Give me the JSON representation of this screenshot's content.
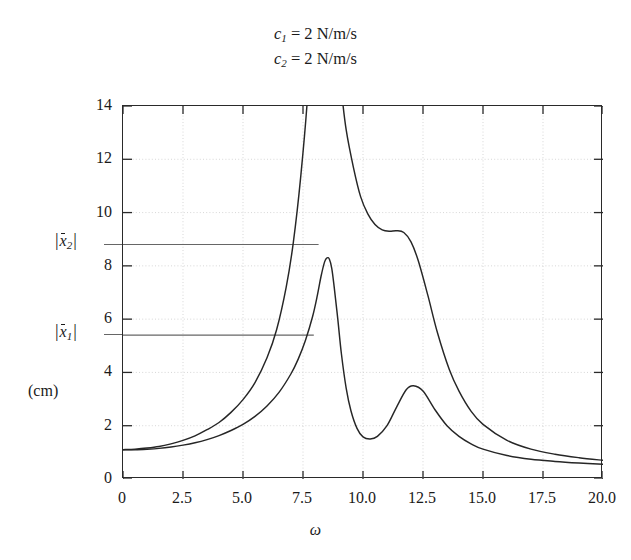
{
  "title": {
    "line1_symbol": "c",
    "line1_sub": "1",
    "line1_rest": "= 2 N/m/s",
    "line2_symbol": "c",
    "line2_sub": "2",
    "line2_rest": "= 2 N/m/s"
  },
  "axes": {
    "xlabel": "ω",
    "ylabel_unit": "(cm)",
    "xticks": [
      "0",
      "2.5",
      "5.0",
      "7.5",
      "10.0",
      "12.5",
      "15.0",
      "17.5",
      "20.0"
    ],
    "yticks": [
      "0",
      "2",
      "4",
      "6",
      "8",
      "10",
      "12",
      "14"
    ]
  },
  "annotations": {
    "ref_upper_symbol": "x",
    "ref_upper_sub": "2",
    "ref_lower_symbol": "x",
    "ref_lower_sub": "1"
  },
  "chart_data": {
    "type": "line",
    "xlabel": "ω",
    "ylabel": "(cm)",
    "xlim": [
      0,
      20
    ],
    "ylim": [
      0,
      14
    ],
    "xticks": [
      0,
      2.5,
      5.0,
      7.5,
      10.0,
      12.5,
      15.0,
      17.5,
      20.0
    ],
    "yticks": [
      0,
      2,
      4,
      6,
      8,
      10,
      12,
      14
    ],
    "grid": true,
    "legend": "none",
    "curve_color": "#262626",
    "refline_color": "#666666",
    "reference_lines": [
      {
        "name": "|x2|",
        "y": 8.8,
        "x_start": 0.0,
        "x_end": 8.15
      },
      {
        "name": "|x1|",
        "y": 5.4,
        "x_start": 0.0,
        "x_end": 7.95
      }
    ],
    "series": [
      {
        "name": "|x1|",
        "x": [
          0,
          0.5,
          1.0,
          1.5,
          2.0,
          2.5,
          3.0,
          3.5,
          4.0,
          4.5,
          5.0,
          5.5,
          6.0,
          6.5,
          7.0,
          7.3,
          7.6,
          7.9,
          8.1,
          8.25,
          8.4,
          8.5,
          8.6,
          8.7,
          8.8,
          8.95,
          9.1,
          9.3,
          9.5,
          9.75,
          10.0,
          10.3,
          10.6,
          11.0,
          11.4,
          11.8,
          12.1,
          12.5,
          13.0,
          13.5,
          14.0,
          14.5,
          15.0,
          16.0,
          17.0,
          18.0,
          19.0,
          20.0
        ],
        "y": [
          1.1,
          1.1,
          1.12,
          1.15,
          1.2,
          1.27,
          1.36,
          1.48,
          1.63,
          1.82,
          2.05,
          2.35,
          2.74,
          3.25,
          3.95,
          4.5,
          5.2,
          6.1,
          6.9,
          7.6,
          8.15,
          8.3,
          8.25,
          7.9,
          7.2,
          6.0,
          4.7,
          3.4,
          2.55,
          1.9,
          1.58,
          1.5,
          1.6,
          2.0,
          2.7,
          3.35,
          3.5,
          3.3,
          2.6,
          2.0,
          1.6,
          1.32,
          1.12,
          0.88,
          0.74,
          0.66,
          0.6,
          0.55
        ]
      },
      {
        "name": "|x2|",
        "x": [
          0,
          0.5,
          1.0,
          1.5,
          2.0,
          2.5,
          3.0,
          3.5,
          4.0,
          4.5,
          5.0,
          5.5,
          6.0,
          6.4,
          6.8,
          7.1,
          7.4,
          7.7,
          7.9,
          8.05,
          8.15,
          8.25,
          8.45,
          8.6,
          8.7,
          8.8,
          8.95,
          9.1,
          9.3,
          9.6,
          9.9,
          10.2,
          10.5,
          10.8,
          11.1,
          11.4,
          11.7,
          12.0,
          12.3,
          12.7,
          13.1,
          13.6,
          14.0,
          14.5,
          15.0,
          16.0,
          17.0,
          18.0,
          19.0,
          20.0
        ],
        "y": [
          1.1,
          1.12,
          1.16,
          1.22,
          1.32,
          1.45,
          1.62,
          1.85,
          2.12,
          2.5,
          2.98,
          3.62,
          4.55,
          5.6,
          7.2,
          8.9,
          11.3,
          14.5,
          18.5,
          24.0,
          30.0,
          36.0,
          34.0,
          26.0,
          21.5,
          18.5,
          16.2,
          14.6,
          13.1,
          11.7,
          10.6,
          9.95,
          9.55,
          9.35,
          9.3,
          9.32,
          9.25,
          8.9,
          8.2,
          6.9,
          5.5,
          4.1,
          3.3,
          2.55,
          2.05,
          1.45,
          1.12,
          0.93,
          0.8,
          0.7
        ]
      }
    ],
    "features": {
      "first_resonance_omega": 8.6,
      "second_resonance_omega_x1": 11.8,
      "x1_peak_value": 8.3,
      "x1_trough_value": 1.5,
      "x1_second_peak_value": 3.5,
      "x2_shoulder_value": 9.3,
      "curve_crossing_omega": 14.0,
      "start_value": 1.1
    }
  }
}
